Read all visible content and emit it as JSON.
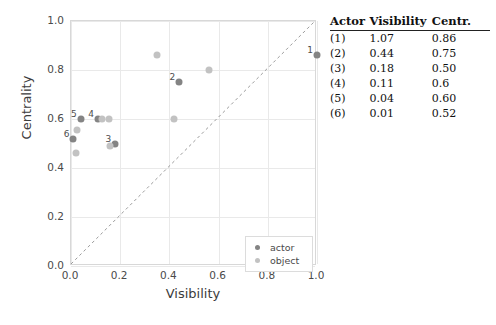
{
  "chart_data": {
    "type": "scatter",
    "title": "",
    "xlabel": "Visibility",
    "ylabel": "Centrality",
    "xlim": [
      0.0,
      1.0
    ],
    "ylim": [
      0.0,
      1.0
    ],
    "xticks": [
      "0.0",
      "0.2",
      "0.4",
      "0.6",
      "0.8",
      "1.0"
    ],
    "xtick_values": [
      0.0,
      0.2,
      0.4,
      0.6,
      0.8,
      1.0
    ],
    "yticks": [
      "0.0",
      "0.2",
      "0.4",
      "0.6",
      "0.8",
      "1.0"
    ],
    "ytick_values": [
      0.0,
      0.2,
      0.4,
      0.6,
      0.8,
      1.0
    ],
    "grid": true,
    "legend_position": "lower right",
    "reference_line": {
      "type": "diagonal-dashed",
      "from": [
        0.0,
        0.0
      ],
      "to": [
        1.0,
        1.0
      ]
    },
    "series": [
      {
        "name": "actor",
        "color": "#848484",
        "points": [
          {
            "label": "1",
            "x": 1.0,
            "y": 0.86
          },
          {
            "label": "2",
            "x": 0.44,
            "y": 0.75
          },
          {
            "label": "3",
            "x": 0.18,
            "y": 0.5
          },
          {
            "label": "4",
            "x": 0.11,
            "y": 0.6
          },
          {
            "label": "5",
            "x": 0.04,
            "y": 0.6
          },
          {
            "label": "6",
            "x": 0.01,
            "y": 0.52
          }
        ]
      },
      {
        "name": "object",
        "color": "#c2c2c2",
        "points": [
          {
            "label": "",
            "x": 0.35,
            "y": 0.86
          },
          {
            "label": "",
            "x": 0.56,
            "y": 0.8
          },
          {
            "label": "",
            "x": 0.42,
            "y": 0.6
          },
          {
            "label": "",
            "x": 0.155,
            "y": 0.6
          },
          {
            "label": "",
            "x": 0.125,
            "y": 0.6
          },
          {
            "label": "",
            "x": 0.025,
            "y": 0.555
          },
          {
            "label": "",
            "x": 0.02,
            "y": 0.46
          },
          {
            "label": "",
            "x": 0.16,
            "y": 0.49
          }
        ]
      }
    ]
  },
  "legend": {
    "items": [
      {
        "label": "actor",
        "color": "#848484"
      },
      {
        "label": "object",
        "color": "#c2c2c2"
      }
    ]
  },
  "table": {
    "headers": [
      "Actor",
      "Visibility",
      "Centr."
    ],
    "rows": [
      {
        "actor": "(1)",
        "visibility": "1.07",
        "centrality": "0.86"
      },
      {
        "actor": "(2)",
        "visibility": "0.44",
        "centrality": "0.75"
      },
      {
        "actor": "(3)",
        "visibility": "0.18",
        "centrality": "0.50"
      },
      {
        "actor": "(4)",
        "visibility": "0.11",
        "centrality": "0.6"
      },
      {
        "actor": "(5)",
        "visibility": "0.04",
        "centrality": "0.60"
      },
      {
        "actor": "(6)",
        "visibility": "0.01",
        "centrality": "0.52"
      }
    ]
  },
  "colors": {
    "actor": "#848484",
    "object": "#c2c2c2",
    "grid": "#e9e9e9",
    "frame": "#d8d8d8",
    "text": "#3c3c3c"
  }
}
